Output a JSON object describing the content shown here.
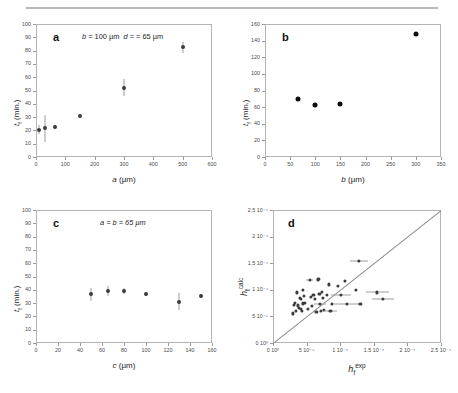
{
  "figure": {
    "panels": [
      "a",
      "b",
      "c",
      "d"
    ],
    "letters": {
      "a": "a",
      "b": "b",
      "c": "c",
      "d": "d"
    }
  },
  "chart_data": [
    {
      "type": "scatter",
      "panel": "a",
      "title": "",
      "annotation": "b = 100 µm   d = = 65 µm",
      "xlabel": "a (µm)",
      "ylabel": "t_f (min.)",
      "xlim": [
        0,
        600
      ],
      "ylim": [
        0,
        100
      ],
      "xticks": [
        0,
        100,
        200,
        300,
        400,
        500,
        600
      ],
      "yticks": [
        0,
        10,
        20,
        30,
        40,
        50,
        60,
        70,
        80,
        90,
        100
      ],
      "grid": false,
      "legend": "none",
      "x": [
        10,
        30,
        65,
        150,
        300,
        500
      ],
      "y": [
        20.5,
        21.5,
        22.5,
        31.0,
        52.0,
        82.5
      ],
      "yerr": [
        3.5,
        10.0,
        1.5,
        1.5,
        6.5,
        4.0
      ]
    },
    {
      "type": "scatter",
      "panel": "b",
      "title": "",
      "annotation": "",
      "xlabel": "b (µm)",
      "ylabel": "t_f (min.)",
      "xlim": [
        0,
        350
      ],
      "ylim": [
        0,
        160
      ],
      "xticks": [
        0,
        50,
        100,
        150,
        200,
        250,
        300,
        350
      ],
      "yticks": [
        0,
        20,
        40,
        60,
        80,
        100,
        120,
        140,
        160
      ],
      "grid": false,
      "legend": "none",
      "x": [
        65,
        100,
        150,
        300
      ],
      "y": [
        70,
        63,
        64,
        148
      ],
      "yerr": [
        0,
        0,
        0,
        0
      ]
    },
    {
      "type": "scatter",
      "panel": "c",
      "title": "",
      "annotation": "a = b = 65 µm",
      "xlabel": "c (µm)",
      "ylabel": "t_f (min.)",
      "xlim": [
        0,
        160
      ],
      "ylim": [
        0,
        100
      ],
      "xticks": [
        0,
        20,
        40,
        60,
        80,
        100,
        120,
        140,
        160
      ],
      "yticks": [
        0,
        10,
        20,
        30,
        40,
        50,
        60,
        70,
        80,
        90,
        100
      ],
      "grid": false,
      "legend": "none",
      "x": [
        50,
        65,
        80,
        100,
        130,
        150
      ],
      "y": [
        36.5,
        39.0,
        39.0,
        36.5,
        31.0,
        35.5
      ],
      "yerr": [
        5.0,
        3.5,
        2.0,
        1.5,
        6.5,
        1.5
      ]
    },
    {
      "type": "scatter",
      "panel": "d",
      "title": "",
      "annotation": "",
      "xlabel": "h_f^exp",
      "ylabel": "h_f^calc",
      "xlim": [
        0,
        0.00025
      ],
      "ylim": [
        0,
        0.00025
      ],
      "xticks": [
        0,
        5e-05,
        0.0001,
        0.00015,
        0.0002,
        0.00025
      ],
      "yticks": [
        0,
        5e-05,
        0.0001,
        0.00015,
        0.0002,
        0.00025
      ],
      "xticklabels": [
        "0 10⁰",
        "5 10⁻⁵",
        "1 10⁻⁴",
        "1.5 10⁻⁴",
        "2 10⁻⁴",
        "2.5 10⁻⁴"
      ],
      "yticklabels": [
        "0 10⁰",
        "5 10⁻⁵",
        "1 10⁻⁴",
        "1.5 10⁻⁴",
        "2 10⁻⁴",
        "2.5 10⁻⁴"
      ],
      "grid": false,
      "legend": "none",
      "identity_line": true,
      "points": [
        {
          "x": 3e-05,
          "y": 5.55e-05,
          "xerr": 0
        },
        {
          "x": 3.1e-05,
          "y": 7.2e-05,
          "xerr": 0
        },
        {
          "x": 3.3e-05,
          "y": 7.6e-05,
          "xerr": 0
        },
        {
          "x": 3.4e-05,
          "y": 6e-05,
          "xerr": 0
        },
        {
          "x": 3.55e-05,
          "y": 9.5e-05,
          "xerr": 0
        },
        {
          "x": 3.7e-05,
          "y": 7.05e-05,
          "xerr": 0
        },
        {
          "x": 3.9e-05,
          "y": 6.6e-05,
          "xerr": 0
        },
        {
          "x": 4e-05,
          "y": 8.55e-05,
          "xerr": 0
        },
        {
          "x": 4.1e-05,
          "y": 8.3e-05,
          "xerr": 0
        },
        {
          "x": 4.15e-05,
          "y": 6.4e-05,
          "xerr": 0
        },
        {
          "x": 4.3e-05,
          "y": 6e-05,
          "xerr": 0
        },
        {
          "x": 4.4e-05,
          "y": 7.45e-05,
          "xerr": 0
        },
        {
          "x": 4.5e-05,
          "y": 0.0001,
          "xerr": 0
        },
        {
          "x": 4.65e-05,
          "y": 8.8e-05,
          "xerr": 0
        },
        {
          "x": 4.8e-05,
          "y": 7.5e-05,
          "xerr": 0
        },
        {
          "x": 5.2e-05,
          "y": 6.45e-05,
          "xerr": 0
        },
        {
          "x": 5.45e-05,
          "y": 0.000119,
          "xerr": 5.5e-06
        },
        {
          "x": 5.6e-05,
          "y": 8.6e-05,
          "xerr": 0
        },
        {
          "x": 5.85e-05,
          "y": 7e-05,
          "xerr": 0
        },
        {
          "x": 6e-05,
          "y": 9.05e-05,
          "xerr": 0
        },
        {
          "x": 6.25e-05,
          "y": 8.25e-05,
          "xerr": 0
        },
        {
          "x": 6.45e-05,
          "y": 5.9e-05,
          "xerr": 0
        },
        {
          "x": 6.65e-05,
          "y": 0.0001195,
          "xerr": 0
        },
        {
          "x": 6.8e-05,
          "y": 0.00012,
          "xerr": 0
        },
        {
          "x": 6.9e-05,
          "y": 9.25e-05,
          "xerr": 0
        },
        {
          "x": 7e-05,
          "y": 7.35e-05,
          "xerr": 9e-06
        },
        {
          "x": 7.15e-05,
          "y": 6.1e-05,
          "xerr": 0
        },
        {
          "x": 7.3e-05,
          "y": 9.55e-05,
          "xerr": 0
        },
        {
          "x": 7.4e-05,
          "y": 8.55e-05,
          "xerr": 0
        },
        {
          "x": 7.6e-05,
          "y": 6.2e-05,
          "xerr": 0
        },
        {
          "x": 8e-05,
          "y": 9.05e-05,
          "xerr": 0
        },
        {
          "x": 8.3e-05,
          "y": 0.00011,
          "xerr": 0
        },
        {
          "x": 8.55e-05,
          "y": 6.05e-05,
          "xerr": 1e-05
        },
        {
          "x": 8.8e-05,
          "y": 7.4e-05,
          "xerr": 0
        },
        {
          "x": 9.6e-05,
          "y": 0.000107,
          "xerr": 0
        },
        {
          "x": 0.000101,
          "y": 9.05e-05,
          "xerr": 1.5e-05
        },
        {
          "x": 0.000107,
          "y": 0.000116,
          "xerr": 0
        },
        {
          "x": 0.00011,
          "y": 7.35e-05,
          "xerr": 2e-05
        },
        {
          "x": 0.000123,
          "y": 0.0001005,
          "xerr": 0
        },
        {
          "x": 0.000128,
          "y": 0.0001545,
          "xerr": 1.3e-05
        },
        {
          "x": 0.00013,
          "y": 7.35e-05,
          "xerr": 0
        },
        {
          "x": 0.000155,
          "y": 9.5e-05,
          "xerr": 1.7e-05
        },
        {
          "x": 0.000164,
          "y": 8.3e-05,
          "xerr": 1.6e-05
        }
      ]
    }
  ],
  "colors": {
    "marker": "#3b3b3b",
    "marker_solid": "#0d0d0d",
    "errorbar": "#9e9e9e",
    "axis": "#b4b4b4",
    "identity_line": "#8a8a8a",
    "text": "#222222",
    "tick_text": "#4a4a4a",
    "background": "#ffffff",
    "top_rule": "#b9b9b9"
  },
  "labels": {
    "panel_a": {
      "x": "a (µm)",
      "y": "t",
      "ysub": "f",
      "yrest": " (min.)",
      "annotation_b": "b",
      "annotation_b_val": " = 100 µm",
      "annotation_d": "d",
      "annotation_d_val": " = = 65 µm"
    },
    "panel_b": {
      "x": "b (µm)",
      "y": "t",
      "ysub": "f",
      "yrest": " (min.)"
    },
    "panel_c": {
      "x": "c (µm)",
      "y": "t",
      "ysub": "f",
      "yrest": " (min.)",
      "annotation": "a = b = 65 µm"
    },
    "panel_d": {
      "x_base": "h",
      "x_sub": "f",
      "x_sup": "exp",
      "y_base": "h",
      "y_sub": "f",
      "y_sup": "calc"
    }
  }
}
